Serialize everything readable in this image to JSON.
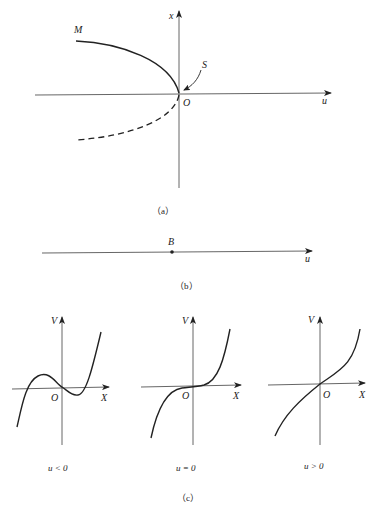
{
  "figure_a": {
    "caption": "（a）",
    "axis_vertical_label": "x",
    "axis_horizontal_label": "u",
    "origin_label": "O",
    "stable_branch_label": "M",
    "saddle_node_label": "S",
    "branches": [
      {
        "name": "stable branch",
        "style": "solid"
      },
      {
        "name": "unstable branch",
        "style": "dashed"
      }
    ]
  },
  "figure_b": {
    "caption": "（b）",
    "point_label": "B",
    "axis_label": "u"
  },
  "figure_c": {
    "caption": "（c）",
    "panels": [
      {
        "axis_vertical_label": "V",
        "axis_horizontal_label": "X",
        "origin_label": "O",
        "condition": "u < 0"
      },
      {
        "axis_vertical_label": "V",
        "axis_horizontal_label": "X",
        "origin_label": "O",
        "condition": "u = 0"
      },
      {
        "axis_vertical_label": "V",
        "axis_horizontal_label": "X",
        "origin_label": "O",
        "condition": "u > 0"
      }
    ]
  },
  "colors": {
    "ink": "#222222",
    "axis": "#555555",
    "background": "#ffffff"
  }
}
